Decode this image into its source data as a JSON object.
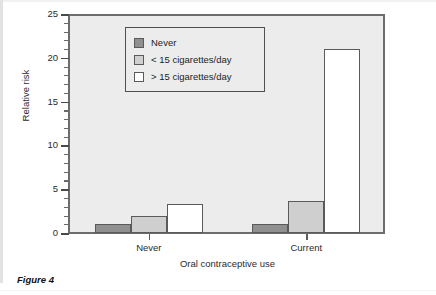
{
  "figure": {
    "caption": "Figure 4"
  },
  "chart_data": {
    "type": "bar",
    "title": "",
    "xlabel": "Oral contraceptive use",
    "ylabel": "Relative risk",
    "categories": [
      "Never",
      "Current"
    ],
    "series": [
      {
        "name": "Never",
        "values": [
          1.0,
          1.0
        ],
        "color": "#909090"
      },
      {
        "name": "< 15 cigarettes/day",
        "values": [
          2.0,
          3.7
        ],
        "color": "#cfcfcf"
      },
      {
        "name": "> 15 cigarettes/day",
        "values": [
          3.3,
          21.0
        ],
        "color": "#ffffff"
      }
    ],
    "ylim": [
      0,
      25
    ],
    "ytick_labels": [
      "0",
      "5",
      "10",
      "15",
      "20",
      "25"
    ],
    "ytick_values": [
      0,
      5,
      10,
      15,
      20,
      25
    ],
    "yminor_step": 1,
    "grid": false,
    "legend_position": "upper-left-inside",
    "plot_background": "#ececec",
    "axis_color": "#6d6d6d"
  }
}
